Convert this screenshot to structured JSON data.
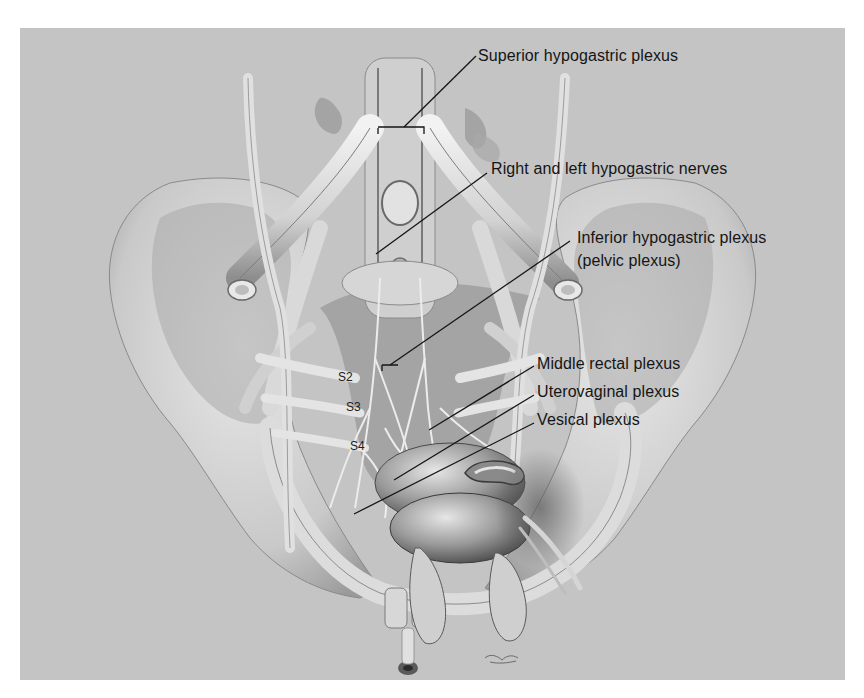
{
  "figure": {
    "background_color": "#c4c4c4",
    "line_color": "#151515",
    "labels": [
      {
        "id": "superior-hypogastric-plexus",
        "text": "Superior hypogastric plexus"
      },
      {
        "id": "hypogastric-nerves",
        "text": "Right and left hypogastric nerves"
      },
      {
        "id": "inferior-hypogastric-plexus-1",
        "text": "Inferior hypogastric plexus"
      },
      {
        "id": "inferior-hypogastric-plexus-2",
        "text": "(pelvic plexus)"
      },
      {
        "id": "middle-rectal-plexus",
        "text": "Middle rectal plexus"
      },
      {
        "id": "uterovaginal-plexus",
        "text": "Uterovaginal plexus"
      },
      {
        "id": "vesical-plexus",
        "text": "Vesical plexus"
      }
    ],
    "sacral_labels": [
      {
        "id": "s2",
        "text": "S2"
      },
      {
        "id": "s3",
        "text": "S3"
      },
      {
        "id": "s4",
        "text": "S4"
      }
    ]
  }
}
